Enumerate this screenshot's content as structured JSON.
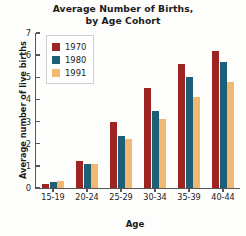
{
  "chart_data": {
    "type": "bar",
    "title": "Average Number of Births, by Age Cohort",
    "title_line1": "Average Number of Births,",
    "title_line2": "by Age Cohort",
    "xlabel": "Age",
    "ylabel": "Average number of live births",
    "ylim": [
      0,
      7
    ],
    "yticks": [
      0,
      1,
      2,
      3,
      4,
      5,
      6,
      7
    ],
    "ytick_labels": [
      "0",
      "1",
      "2",
      "3",
      "4",
      "5",
      "6",
      "7"
    ],
    "grid": false,
    "legend_position": "upper-left-inside",
    "categories": [
      "15-19",
      "20-24",
      "25-29",
      "30-34",
      "35-39",
      "40-44"
    ],
    "series": [
      {
        "name": "1970",
        "color": "#9d2420",
        "values": [
          0.2,
          1.2,
          3.0,
          4.5,
          5.6,
          6.2
        ]
      },
      {
        "name": "1980",
        "color": "#1d5f77",
        "values": [
          0.25,
          1.1,
          2.35,
          3.5,
          5.0,
          5.7
        ]
      },
      {
        "name": "1991",
        "color": "#f0b870",
        "values": [
          0.3,
          1.1,
          2.2,
          3.1,
          4.1,
          4.8
        ]
      }
    ]
  }
}
